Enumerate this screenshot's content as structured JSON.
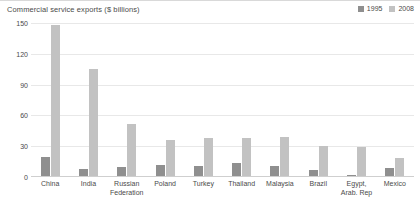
{
  "chart_data": {
    "type": "bar",
    "title": "Commercial service exports ($ billions)",
    "xlabel": "",
    "ylabel": "",
    "ylim": [
      0,
      150
    ],
    "yticks": [
      150,
      120,
      90,
      60,
      30,
      0
    ],
    "grid": true,
    "legend_position": "top-right",
    "categories": [
      "China",
      "India",
      "Russian\nFederation",
      "Poland",
      "Turkey",
      "Thailand",
      "Malaysia",
      "Brazil",
      "Egypt,\nArab. Rep",
      "Mexico"
    ],
    "series": [
      {
        "name": "1995",
        "color": "#8f8f8f",
        "values": [
          19,
          7,
          9,
          11,
          10,
          13,
          10,
          6,
          1,
          8
        ]
      },
      {
        "name": "2008",
        "color": "#c2c2c2",
        "values": [
          147,
          104,
          51,
          35,
          37,
          37,
          38,
          29,
          28,
          18
        ]
      }
    ]
  }
}
